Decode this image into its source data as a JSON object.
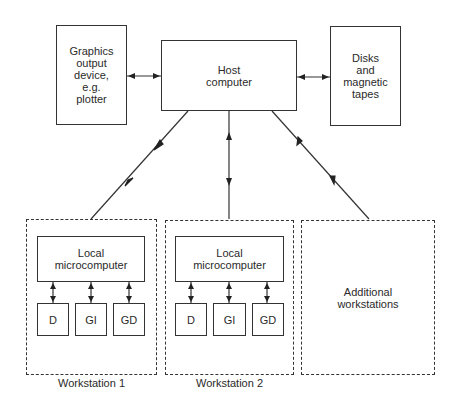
{
  "diagram": {
    "graphics_device": {
      "label": "Graphics\noutput\ndevice,\ne.g.\nplotter"
    },
    "host": {
      "label": "Host\ncomputer"
    },
    "storage": {
      "label": "Disks\nand\nmagnetic\ntapes"
    },
    "workstations": [
      {
        "name": "Workstation 1",
        "local": "Local\nmicrocomputer",
        "devices": [
          "D",
          "GI",
          "GD"
        ]
      },
      {
        "name": "Workstation 2",
        "local": "Local\nmicrocomputer",
        "devices": [
          "D",
          "GI",
          "GD"
        ]
      }
    ],
    "additional": {
      "label": "Additional\nworkstations"
    },
    "connections": [
      {
        "from": "graphics_device",
        "to": "host",
        "type": "bidirectional"
      },
      {
        "from": "host",
        "to": "storage",
        "type": "bidirectional"
      },
      {
        "from": "host",
        "to": "workstation_1",
        "type": "bidirectional"
      },
      {
        "from": "host",
        "to": "workstation_2",
        "type": "bidirectional"
      },
      {
        "from": "host",
        "to": "additional_workstations",
        "type": "bidirectional"
      },
      {
        "from": "local_microcomputer",
        "to": "D",
        "type": "bidirectional"
      },
      {
        "from": "local_microcomputer",
        "to": "GI",
        "type": "bidirectional"
      },
      {
        "from": "local_microcomputer",
        "to": "GD",
        "type": "bidirectional"
      }
    ]
  }
}
